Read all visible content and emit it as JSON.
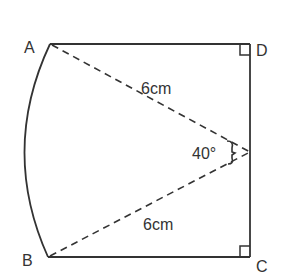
{
  "diagram": {
    "points": {
      "A": {
        "label": "A",
        "x": 50,
        "y": 44
      },
      "B": {
        "label": "B",
        "x": 48,
        "y": 257
      },
      "C": {
        "label": "C",
        "x": 250,
        "y": 257
      },
      "D": {
        "label": "D",
        "x": 250,
        "y": 44
      },
      "O": {
        "x": 250,
        "y": 152
      }
    },
    "labels": {
      "radius_top": "6cm",
      "radius_bottom": "6cm",
      "angle": "40°"
    },
    "colors": {
      "stroke": "#333333",
      "background": "#ffffff"
    }
  }
}
